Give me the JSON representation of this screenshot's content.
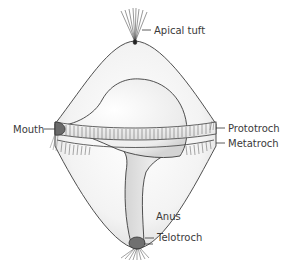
{
  "diagram": {
    "colors": {
      "outline": "#3c3c3c",
      "body_fill": "#f2f2f2",
      "gut_fill": "#e2e2e2",
      "mouth_fill": "#6a6a6a",
      "anus_fill": "#707070",
      "label_text": "#3a3a3a"
    },
    "labels": {
      "apical_tuft": "Apical tuft",
      "mouth": "Mouth",
      "prototroch": "Prototroch",
      "metatroch": "Metatroch",
      "anus": "Anus",
      "telotroch": "Telotroch"
    }
  }
}
